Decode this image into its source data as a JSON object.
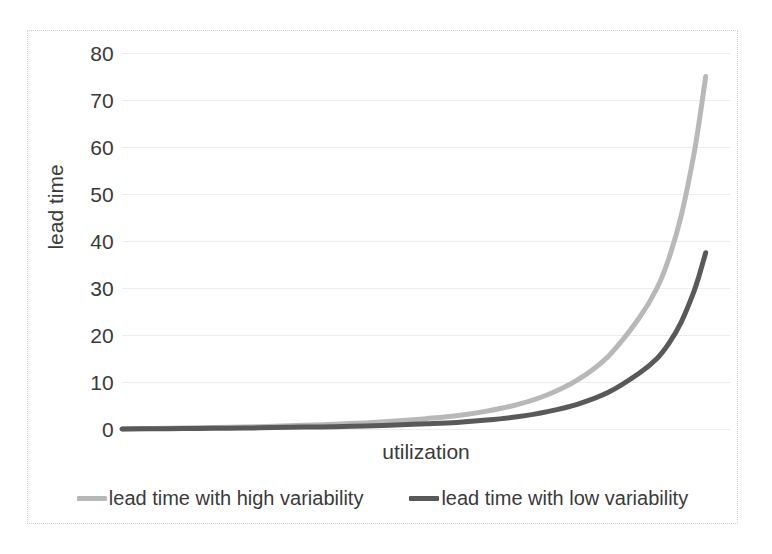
{
  "chart_data": {
    "type": "line",
    "title": "",
    "xlabel": "utilization",
    "ylabel": "lead time",
    "grid": true,
    "legend_position": "bottom",
    "xlim": [
      0,
      1
    ],
    "ylim": [
      0,
      80
    ],
    "y_ticks": [
      80,
      70,
      60,
      50,
      40,
      30,
      20,
      10,
      0
    ],
    "x_ticks": [],
    "series": [
      {
        "name": "lead time with high variability",
        "color": "#b8b8b8",
        "x": [
          0.0,
          0.05,
          0.1,
          0.15,
          0.2,
          0.25,
          0.3,
          0.35,
          0.4,
          0.45,
          0.5,
          0.55,
          0.6,
          0.65,
          0.7,
          0.75,
          0.8,
          0.85,
          0.88,
          0.9,
          0.92,
          0.94,
          0.95,
          0.96
        ],
        "values": [
          0.0,
          0.1,
          0.2,
          0.3,
          0.4,
          0.6,
          0.8,
          1.0,
          1.3,
          1.7,
          2.2,
          2.8,
          3.8,
          5.2,
          7.3,
          10.5,
          15.5,
          23.5,
          30.0,
          36.5,
          45.5,
          58.0,
          66.0,
          75.0
        ],
        "end_value": 75.0
      },
      {
        "name": "lead time with low variability",
        "color": "#595959",
        "x": [
          0.0,
          0.05,
          0.1,
          0.15,
          0.2,
          0.25,
          0.3,
          0.35,
          0.4,
          0.45,
          0.5,
          0.55,
          0.6,
          0.65,
          0.7,
          0.75,
          0.8,
          0.85,
          0.88,
          0.9,
          0.92,
          0.94,
          0.95,
          0.96
        ],
        "values": [
          0.0,
          0.05,
          0.1,
          0.15,
          0.2,
          0.3,
          0.4,
          0.5,
          0.65,
          0.85,
          1.1,
          1.4,
          1.9,
          2.6,
          3.7,
          5.3,
          7.8,
          11.8,
          15.0,
          18.3,
          22.8,
          29.0,
          33.0,
          37.5
        ],
        "end_value": 37.5
      }
    ]
  },
  "axis": {
    "y_title": "lead time",
    "x_title": "utilization",
    "y_tick_labels": [
      "80",
      "70",
      "60",
      "50",
      "40",
      "30",
      "20",
      "10",
      "0"
    ]
  },
  "legend": {
    "items": [
      {
        "label": "lead time with high variability",
        "color": "#b8b8b8"
      },
      {
        "label": "lead time with low variability",
        "color": "#595959"
      }
    ]
  },
  "colors": {
    "background": "#ffffff",
    "frame_border": "#d2d2d2",
    "gridline": "#ececed",
    "text": "#3a3a3a",
    "series_high_variability": "#b8b8b8",
    "series_low_variability": "#595959"
  }
}
